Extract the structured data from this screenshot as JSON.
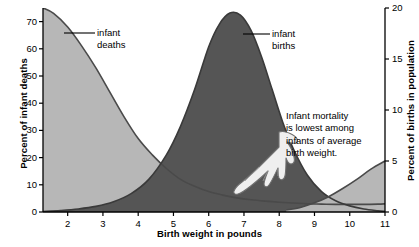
{
  "chart_data": {
    "type": "area",
    "title": "",
    "xlabel": "Birth weight in pounds",
    "ylabel_left": "Percent of infant deaths",
    "ylabel_right": "Percent of births in population",
    "xlim": [
      1.3,
      11
    ],
    "xticks": [
      2,
      3,
      4,
      5,
      6,
      7,
      8,
      9,
      10,
      11
    ],
    "ylim_left": [
      0,
      75
    ],
    "yticks_left": [
      0,
      10,
      20,
      30,
      40,
      50,
      60,
      70
    ],
    "ylim_right": [
      0,
      20
    ],
    "yticks_right": [
      0,
      5,
      10,
      15,
      20
    ],
    "grid": false,
    "legend_position": "inline-callouts",
    "series": [
      {
        "name": "infant deaths",
        "axis": "left",
        "color": "#b7b7b7",
        "line_color": "#4a4a4a",
        "x": [
          1.3,
          1.6,
          2.0,
          2.4,
          2.8,
          3.2,
          3.6,
          4.0,
          4.4,
          4.8,
          5.2,
          5.6,
          6.0,
          6.4,
          6.8,
          7.2,
          7.6,
          8.0,
          8.4,
          8.8,
          9.2,
          9.6,
          10.0,
          10.4,
          10.8,
          11.0
        ],
        "values": [
          75,
          73,
          68,
          61,
          53,
          44,
          35,
          27,
          21,
          16,
          12,
          9.5,
          7.5,
          6.2,
          5.2,
          4.5,
          4.0,
          3.6,
          3.3,
          3.0,
          2.9,
          2.8,
          2.8,
          2.8,
          2.9,
          3.0
        ]
      },
      {
        "name": "infant births",
        "axis": "right",
        "color": "#555555",
        "line_color": "#3a3a3a",
        "x": [
          1.3,
          1.8,
          2.3,
          2.8,
          3.3,
          3.8,
          4.3,
          4.8,
          5.2,
          5.6,
          6.0,
          6.3,
          6.6,
          6.9,
          7.2,
          7.5,
          7.8,
          8.1,
          8.4,
          8.8,
          9.2,
          9.6,
          10.0,
          10.4,
          10.8,
          11.0
        ],
        "values": [
          0.05,
          0.15,
          0.3,
          0.55,
          1.0,
          1.8,
          3.2,
          5.6,
          8.4,
          12.0,
          16.2,
          18.4,
          19.5,
          19.3,
          17.8,
          15.2,
          12.0,
          8.8,
          6.2,
          3.6,
          2.0,
          1.1,
          0.6,
          0.3,
          0.12,
          0.05
        ]
      },
      {
        "name": "deaths-right-tail",
        "axis": "right",
        "color": "#b7b7b7",
        "line_color": "#4a4a4a",
        "note": "upturn of infant-deaths curve at heavy birth weights rising toward 5 on the right scale",
        "x": [
          8.2,
          8.6,
          9.0,
          9.4,
          9.8,
          10.2,
          10.6,
          11.0
        ],
        "values": [
          0.2,
          0.45,
          0.9,
          1.5,
          2.3,
          3.2,
          4.2,
          5.0
        ]
      }
    ],
    "callouts": [
      {
        "name": "infant-deaths",
        "text_lines": [
          "infant",
          "deaths"
        ],
        "leader_to_x": 2.9,
        "leader_to_y_left": 64
      },
      {
        "name": "infant-births",
        "text_lines": [
          "infant",
          "births"
        ],
        "leader_to_x": 7.6,
        "leader_to_y_right": 17.0
      }
    ],
    "annotation": {
      "lines": [
        "Infant mortality",
        "is lowest among",
        "infants of average",
        "birth weight."
      ],
      "pointer_icon": "pointing-hand-icon",
      "points_to_x": 7.0
    }
  },
  "axes": {
    "x_title": "Birth weight in pounds",
    "y_left_title": "Percent of infant deaths",
    "y_right_title": "Percent of births in population",
    "x_ticks": [
      "2",
      "3",
      "4",
      "5",
      "6",
      "7",
      "8",
      "9",
      "10",
      "11"
    ],
    "y_left_ticks": [
      "70",
      "60",
      "50",
      "40",
      "30",
      "20",
      "10",
      "0"
    ],
    "y_right_ticks": [
      "20",
      "15",
      "10",
      "5",
      "0"
    ]
  },
  "labels": {
    "deaths_line1": "infant",
    "deaths_line2": "deaths",
    "births_line1": "infant",
    "births_line2": "births",
    "annotation_line1": "Infant mortality",
    "annotation_line2": "is lowest among",
    "annotation_line3": "infants of average",
    "annotation_line4": "birth weight."
  },
  "colors": {
    "deaths_fill": "#b7b7b7",
    "births_fill": "#555555",
    "deaths_line": "#4a4a4a",
    "births_line": "#3a3a3a",
    "axis": "#000000",
    "background": "#ffffff"
  }
}
